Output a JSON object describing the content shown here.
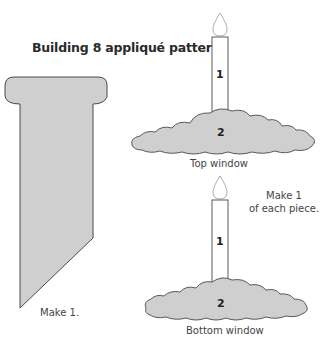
{
  "title": "Building 8 appliqué patterns",
  "colors": {
    "fill": "#cfcfcf",
    "stroke": "#4a4a4a",
    "flame_stroke": "#9a9a9a",
    "text": "#444444"
  },
  "left_piece": {
    "label": "Make 1."
  },
  "top_window": {
    "caption": "Top window",
    "candle_number": "1",
    "cloud_number": "2"
  },
  "bottom_window": {
    "caption": "Bottom window",
    "candle_number": "1",
    "cloud_number": "2"
  },
  "note": {
    "line1": "Make 1",
    "line2": "of each piece."
  }
}
